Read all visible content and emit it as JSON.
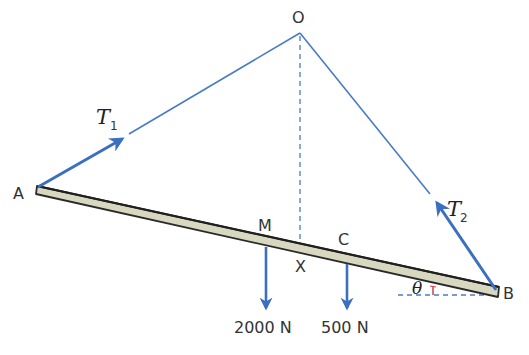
{
  "diagram": {
    "type": "statics-beam-tension",
    "points": {
      "O": {
        "label": "O",
        "x": 300,
        "y": 33
      },
      "A": {
        "label": "A",
        "x": 37,
        "y": 188
      },
      "B": {
        "label": "B",
        "x": 497,
        "y": 292
      },
      "M": {
        "label": "M",
        "x": 266,
        "y": 245
      },
      "C": {
        "label": "C",
        "x": 347,
        "y": 262
      },
      "X": {
        "label": "X",
        "x": 300,
        "y": 253
      }
    },
    "tensions": {
      "T1": {
        "symbol": "T",
        "subscript": "1"
      },
      "T2": {
        "symbol": "T",
        "subscript": "2"
      }
    },
    "loads": {
      "M_load": {
        "value": "2000",
        "unit": "N",
        "text": "2000 N"
      },
      "C_load": {
        "value": "500",
        "unit": "N",
        "text": "500 N"
      }
    },
    "angle": {
      "symbol": "θ"
    },
    "colors": {
      "string": "#4a7cc4",
      "arrow": "#3b6fbf",
      "beam_fill": "#d8d8c0",
      "beam_edge": "#2a2a2a",
      "angle_mark": "#d04040",
      "text": "#333333"
    }
  }
}
